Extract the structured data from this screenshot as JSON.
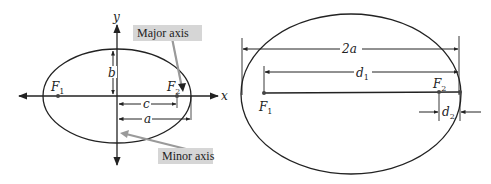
{
  "left_diagram": {
    "title": "Ellipse with axes",
    "axis_labels": {
      "x": "x",
      "y": "y"
    },
    "foci": [
      {
        "label": "F",
        "sub": "1"
      },
      {
        "label": "F",
        "sub": "2"
      }
    ],
    "dimensions": {
      "b": "b",
      "c": "c",
      "a": "a"
    },
    "callouts": {
      "major": "Major axis",
      "minor": "Minor axis"
    }
  },
  "right_diagram": {
    "title": "Sum of focal distances",
    "dimensions": {
      "two_a": "2a",
      "d1": {
        "label": "d",
        "sub": "1"
      },
      "d2": {
        "label": "d",
        "sub": "2"
      }
    },
    "foci": [
      {
        "label": "F",
        "sub": "1"
      },
      {
        "label": "F",
        "sub": "2"
      }
    ]
  },
  "colors": {
    "stroke": "#222222",
    "callout_bg": "#d6d6d6",
    "callout_arrow": "#9a9a9a"
  }
}
